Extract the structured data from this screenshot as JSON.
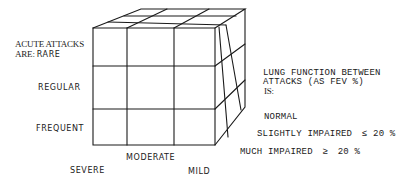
{
  "diagram": {
    "type": "3x3x3 cube classification",
    "axes": {
      "acute_attacks": {
        "title_line1": "ACUTE ATTACKS",
        "title_line2_prefix": "ARE:",
        "levels": [
          "RARE",
          "REGULAR",
          "FREQUENT"
        ]
      },
      "severity": {
        "levels": [
          "SEVERE",
          "MODERATE",
          "MILD"
        ]
      },
      "lung_function": {
        "title_line1": "LUNG FUNCTION BETWEEN",
        "title_line2": "ATTACKS (AS FEV %)",
        "title_line3": "IS:",
        "levels": [
          {
            "label": "NORMAL",
            "symbol": "",
            "value": ""
          },
          {
            "label": "SLIGHTLY IMPAIRED",
            "symbol": "≤",
            "value": "20 %"
          },
          {
            "label": "MUCH IMPAIRED",
            "symbol": "≥",
            "value": "20 %"
          }
        ]
      }
    },
    "stroke_color": "#1a1a1a",
    "background": "#ffffff"
  }
}
